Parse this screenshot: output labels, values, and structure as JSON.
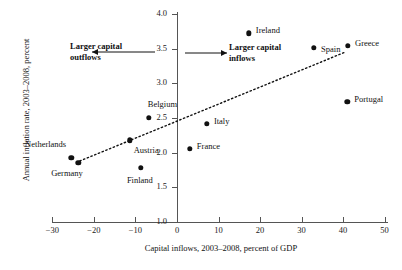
{
  "chart_data": {
    "type": "scatter",
    "title": "",
    "xlabel": "Capital inflows, 2003–2008, percent of GDP",
    "ylabel": "Annual inflation rate, 2003–2008, percent",
    "xlim": [
      -30,
      50
    ],
    "ylim": [
      1.0,
      4.0
    ],
    "xticks": [
      -30,
      -20,
      -10,
      0,
      10,
      20,
      30,
      40,
      50
    ],
    "xtick_labels": [
      "−30",
      "−20",
      "−10",
      "0",
      "10",
      "20",
      "30",
      "40",
      "50"
    ],
    "yticks": [
      1.0,
      1.5,
      2.0,
      2.5,
      3.0,
      3.5,
      4.0
    ],
    "ytick_labels": [
      "1.0",
      "1.5",
      "2.0",
      "2.5",
      "3.0",
      "3.5",
      "4.0"
    ],
    "grid": false,
    "legend": "none",
    "points": [
      {
        "label": "Ireland",
        "x": 17.3,
        "y": 3.72,
        "label_dx": 7,
        "label_dy": -3
      },
      {
        "label": "Greece",
        "x": 41.2,
        "y": 3.54,
        "label_dx": 7,
        "label_dy": -3
      },
      {
        "label": "Spain",
        "x": 33.0,
        "y": 3.51,
        "label_dx": 7,
        "label_dy": 1
      },
      {
        "label": "Portugal",
        "x": 41.0,
        "y": 2.73,
        "label_dx": 7,
        "label_dy": -3
      },
      {
        "label": "Belgium",
        "x": -6.8,
        "y": 2.5,
        "label_dx": -1,
        "label_dy": -14
      },
      {
        "label": "Italy",
        "x": 7.2,
        "y": 2.42,
        "label_dx": 7,
        "label_dy": -3
      },
      {
        "label": "Austria",
        "x": -11.4,
        "y": 2.18,
        "label_dx": 4,
        "label_dy": 10
      },
      {
        "label": "France",
        "x": 3.1,
        "y": 2.06,
        "label_dx": 7,
        "label_dy": -3
      },
      {
        "label": "Netherlands",
        "x": -25.5,
        "y": 1.93,
        "label_dx": -46,
        "label_dy": -14
      },
      {
        "label": "Germany",
        "x": -23.8,
        "y": 1.85,
        "label_dx": -27,
        "label_dy": 10
      },
      {
        "label": "Finland",
        "x": -8.7,
        "y": 1.78,
        "label_dx": -14,
        "label_dy": 12
      }
    ],
    "trendline": {
      "x0": -23.4,
      "y0": 1.88,
      "x1": 40.5,
      "y1": 3.45,
      "style": "dotted"
    },
    "annotations": [
      {
        "name": "outflows",
        "line1": "Larger capital",
        "line2": "outflows",
        "text_x": 70,
        "text_y": 41,
        "arrow_x1": 155,
        "arrow_x2": 92,
        "arrow_y": 52,
        "direction": "left"
      },
      {
        "name": "inflows",
        "line1": "Larger capital",
        "line2": "inflows",
        "text_x": 229,
        "text_y": 42,
        "arrow_x1": 185,
        "arrow_x2": 227,
        "arrow_y": 53,
        "direction": "right"
      }
    ],
    "colors": {
      "point": "#111111",
      "axis": "#555555",
      "text": "#1a1a1a"
    }
  }
}
